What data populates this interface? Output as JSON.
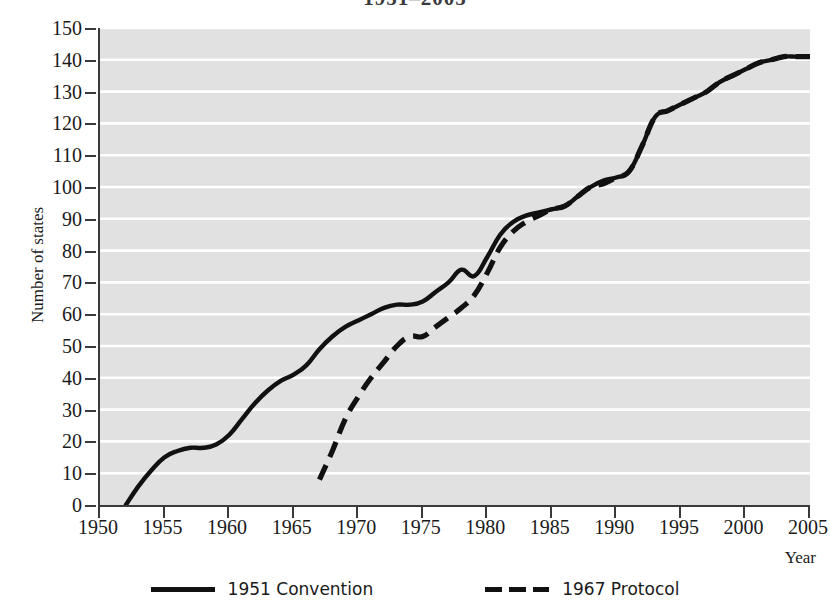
{
  "chart_data": {
    "type": "line",
    "title": "1951–2005",
    "xlabel": "Year",
    "ylabel": "Number of states",
    "xlim": [
      1950,
      2005
    ],
    "ylim": [
      0,
      150
    ],
    "xticks": [
      1950,
      1955,
      1960,
      1965,
      1970,
      1975,
      1980,
      1985,
      1990,
      1995,
      2000,
      2005
    ],
    "yticks": [
      0,
      10,
      20,
      30,
      40,
      50,
      60,
      70,
      80,
      90,
      100,
      110,
      120,
      130,
      140,
      150
    ],
    "grid": "horizontal-white",
    "legend_position": "bottom-center",
    "plot_background": "#e1e1e1",
    "line_color": "#111111",
    "series": [
      {
        "name": "1951 Convention",
        "style": "solid",
        "x": [
          1952,
          1953,
          1954,
          1955,
          1956,
          1957,
          1958,
          1959,
          1960,
          1961,
          1962,
          1963,
          1964,
          1965,
          1966,
          1967,
          1968,
          1969,
          1970,
          1971,
          1972,
          1973,
          1974,
          1975,
          1976,
          1977,
          1978,
          1979,
          1980,
          1981,
          1982,
          1983,
          1984,
          1985,
          1986,
          1987,
          1988,
          1989,
          1990,
          1991,
          1992,
          1993,
          1994,
          1995,
          1996,
          1997,
          1998,
          1999,
          2000,
          2001,
          2002,
          2003,
          2004,
          2005
        ],
        "y": [
          0,
          6,
          11,
          15,
          17,
          18,
          18,
          19,
          22,
          27,
          32,
          36,
          39,
          41,
          44,
          49,
          53,
          56,
          58,
          60,
          62,
          63,
          63,
          64,
          67,
          70,
          74,
          72,
          78,
          85,
          89,
          91,
          92,
          93,
          94,
          97,
          100,
          102,
          103,
          105,
          113,
          122,
          124,
          126,
          128,
          130,
          133,
          135,
          137,
          139,
          140,
          141,
          141,
          141
        ]
      },
      {
        "name": "1967 Protocol",
        "style": "dashed",
        "x": [
          1967,
          1968,
          1969,
          1970,
          1971,
          1972,
          1973,
          1974,
          1975,
          1976,
          1977,
          1978,
          1979,
          1980,
          1981,
          1982,
          1983,
          1984,
          1985,
          1986,
          1987,
          1988,
          1989,
          1990,
          1991,
          1992,
          1993,
          1994,
          1995,
          1996,
          1997,
          1998,
          1999,
          2000,
          2001,
          2002,
          2003,
          2004,
          2005
        ],
        "y": [
          8,
          17,
          27,
          34,
          40,
          45,
          50,
          53,
          53,
          56,
          59,
          62,
          66,
          73,
          81,
          86,
          89,
          91,
          93,
          94,
          97,
          100,
          101,
          103,
          105,
          113,
          122,
          124,
          126,
          128,
          130,
          133,
          135,
          137,
          139,
          140,
          141,
          141,
          141
        ]
      }
    ]
  },
  "legend": {
    "entries": [
      {
        "label": "1951 Convention",
        "style": "solid"
      },
      {
        "label": "1967 Protocol",
        "style": "dashed"
      }
    ]
  }
}
